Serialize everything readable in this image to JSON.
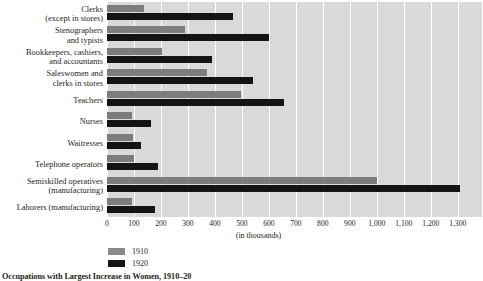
{
  "caption": "Occupations with Largest Increase in Women, 1910–20",
  "axis": {
    "title": "(in thousands)",
    "ticks": [
      "0",
      "100",
      "200",
      "300",
      "400",
      "500",
      "600",
      "700",
      "800",
      "900",
      "1,000",
      "1,100",
      "1,200",
      "1,300"
    ],
    "min": 0,
    "max": 1390,
    "step": 100
  },
  "legend": {
    "position": "bottom-left",
    "entries": [
      {
        "label": "1910",
        "color": "#8a8a8a"
      },
      {
        "label": "1920",
        "color": "#141414"
      }
    ]
  },
  "chart_data": {
    "type": "bar",
    "orientation": "horizontal",
    "title": "Occupations with Largest Increase in Women, 1910–20",
    "xlabel": "(in thousands)",
    "ylabel": "",
    "xlim": [
      0,
      1390
    ],
    "grid": true,
    "categories": [
      "Clerks\n(except in stores)",
      "Stenographers\nand typists",
      "Bookkeepers, cashiers,\nand accountants",
      "Saleswomen and\nclerks in stores",
      "Teachers",
      "Nurses",
      "Waitresses",
      "Telephone operators",
      "Semiskilled operatives\n(manufacturing)",
      "Laborers (manufacturing)"
    ],
    "series": [
      {
        "name": "1910",
        "color": "#7d7d7d",
        "values": [
          137,
          289,
          204,
          370,
          496,
          93,
          97,
          99,
          1000,
          93
        ]
      },
      {
        "name": "1920",
        "color": "#141414",
        "values": [
          467,
          600,
          389,
          541,
          656,
          163,
          126,
          190,
          1310,
          178
        ]
      }
    ]
  },
  "rows": [
    {
      "label_line1": "Clerks",
      "label_line2": "(except in stores)"
    },
    {
      "label_line1": "Stenographers",
      "label_line2": "and typists"
    },
    {
      "label_line1": "Bookkeepers, cashiers,",
      "label_line2": "and accountants"
    },
    {
      "label_line1": "Saleswomen and",
      "label_line2": "clerks in stores"
    },
    {
      "label_line1": "Teachers",
      "label_line2": ""
    },
    {
      "label_line1": "Nurses",
      "label_line2": ""
    },
    {
      "label_line1": "Waitresses",
      "label_line2": ""
    },
    {
      "label_line1": "Telephone operators",
      "label_line2": ""
    },
    {
      "label_line1": "Semiskilled operatives",
      "label_line2": "(manufacturing)"
    },
    {
      "label_line1": "Laborers (manufacturing)",
      "label_line2": ""
    }
  ]
}
